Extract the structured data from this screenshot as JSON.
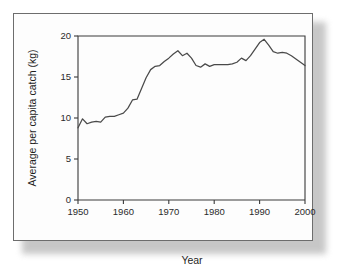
{
  "chart_data": {
    "type": "line",
    "title": "",
    "xlabel": "Year",
    "ylabel": "Average per capita catch (kg)",
    "xlim": [
      1950,
      2000
    ],
    "ylim": [
      0,
      20
    ],
    "xticks": [
      1950,
      1960,
      1970,
      1980,
      1990,
      2000
    ],
    "yticks": [
      0,
      5,
      10,
      15,
      20
    ],
    "xtick_labels": [
      "1950",
      "1960",
      "1970",
      "1980",
      "1990",
      "2000"
    ],
    "ytick_labels": [
      "0",
      "5",
      "10",
      "15",
      "20"
    ],
    "grid": false,
    "legend": false,
    "legend_position": "none",
    "line_color": "#4a4a4a",
    "frame_color": "#3a3a3a",
    "background_color": "#fdfdfd",
    "x": [
      1950,
      1951,
      1952,
      1953,
      1954,
      1955,
      1956,
      1957,
      1958,
      1959,
      1960,
      1961,
      1962,
      1963,
      1964,
      1965,
      1966,
      1967,
      1968,
      1969,
      1970,
      1971,
      1972,
      1973,
      1974,
      1975,
      1976,
      1977,
      1978,
      1979,
      1980,
      1981,
      1982,
      1983,
      1984,
      1985,
      1986,
      1987,
      1988,
      1989,
      1990,
      1991,
      1992,
      1993,
      1994,
      1995,
      1996,
      1997,
      1998,
      1999,
      2000
    ],
    "values": [
      8.8,
      9.9,
      9.3,
      9.5,
      9.6,
      9.5,
      10.1,
      10.2,
      10.2,
      10.4,
      10.6,
      11.2,
      12.2,
      12.3,
      13.6,
      14.9,
      15.9,
      16.3,
      16.4,
      16.9,
      17.3,
      17.8,
      18.2,
      17.6,
      17.9,
      17.3,
      16.4,
      16.2,
      16.6,
      16.3,
      16.5,
      16.5,
      16.5,
      16.5,
      16.6,
      16.8,
      17.3,
      17.0,
      17.6,
      18.4,
      19.2,
      19.6,
      18.9,
      18.1,
      17.9,
      18.0,
      17.9,
      17.6,
      17.2,
      16.8,
      16.4
    ],
    "series_name": "Average per capita catch",
    "units": "kg"
  },
  "figure": {
    "y_axis_label": "Average per capita catch (kg)",
    "x_axis_label": "Year"
  }
}
